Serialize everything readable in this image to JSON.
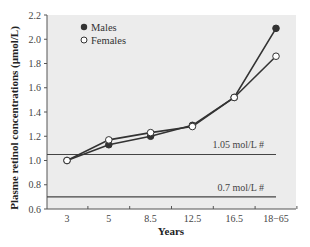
{
  "chart_data": {
    "type": "line",
    "title": "",
    "xlabel": "Years",
    "ylabel": "Plasme retinol concentrations (µmol/L)",
    "categories": [
      "3",
      "5",
      "8.5",
      "12.5",
      "16.5",
      "18−65"
    ],
    "series": [
      {
        "name": "Males",
        "marker": "filled-circle",
        "values": [
          1.0,
          1.13,
          1.2,
          1.29,
          1.52,
          2.09
        ]
      },
      {
        "name": "Females",
        "marker": "open-circle",
        "values": [
          1.0,
          1.17,
          1.23,
          1.28,
          1.52,
          1.86
        ]
      }
    ],
    "yticks": [
      "0.6",
      "0.8",
      "1.0",
      "1.2",
      "1.4",
      "1.6",
      "1.8",
      "2.0",
      "2.2"
    ],
    "ylim": [
      0.6,
      2.2
    ],
    "reference_lines": [
      {
        "value": 1.05,
        "label": "1.05 mol/L #"
      },
      {
        "value": 0.7,
        "label": "0.7 mol/L #"
      }
    ],
    "legend_position": "upper left",
    "grid": false,
    "colors": {
      "plot_background": "#ececec",
      "line": "#333333",
      "axis": "#555555"
    }
  }
}
